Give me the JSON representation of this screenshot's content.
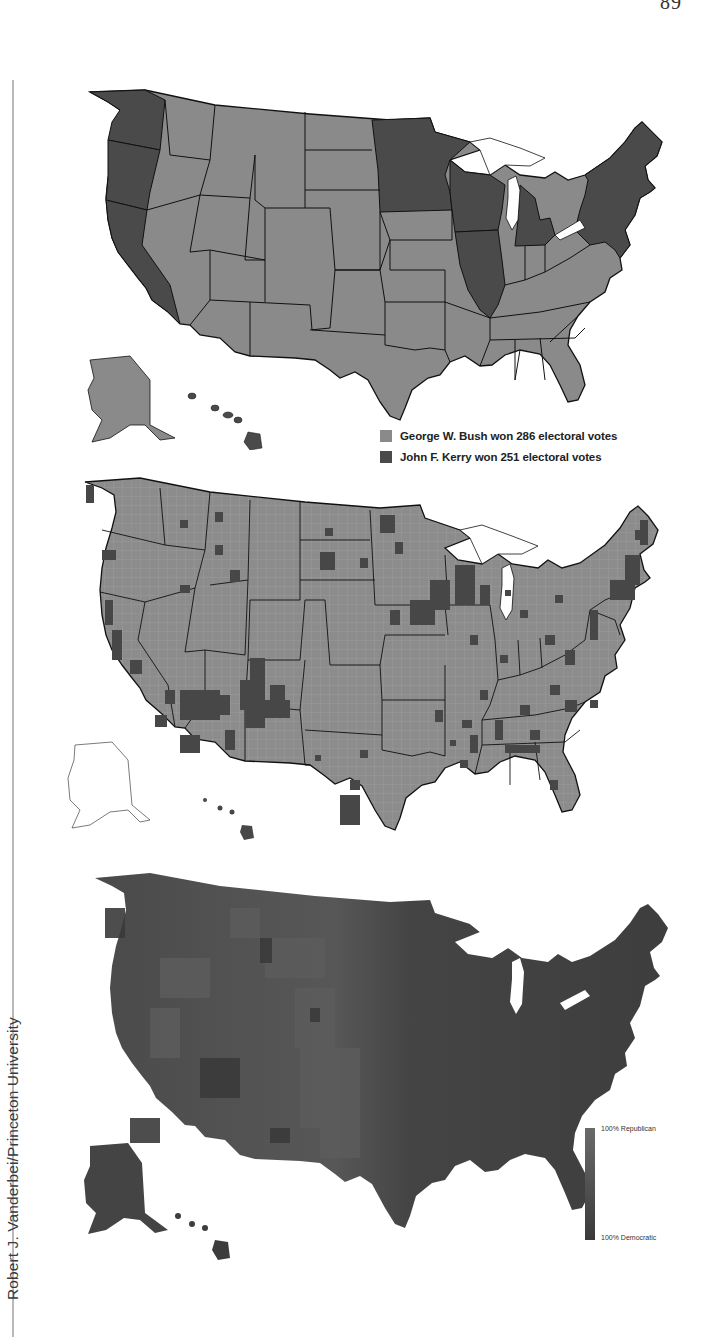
{
  "page": {
    "number": "89",
    "credit": "Robert J. Vanderbei/Princeton University"
  },
  "colors": {
    "bush": "#8a8a8a",
    "kerry": "#4a4a4a",
    "county_dark": "#474747",
    "purple_base": "#4b4b4b",
    "background": "#ffffff",
    "border": "#111111"
  },
  "maps": [
    {
      "id": "state-results",
      "description": "2004 presidential election results by state",
      "legend": [
        {
          "label": "George W. Bush won 286 electoral votes",
          "color": "#8a8a8a"
        },
        {
          "label": "John F. Kerry won 251 electoral votes",
          "color": "#4a4a4a"
        }
      ]
    },
    {
      "id": "county-results",
      "description": "2004 presidential election results by county"
    },
    {
      "id": "purple-map",
      "description": "County results shaded by vote share",
      "scale": {
        "top_label": "100% Republican",
        "bottom_label": "100% Democratic"
      }
    }
  ]
}
